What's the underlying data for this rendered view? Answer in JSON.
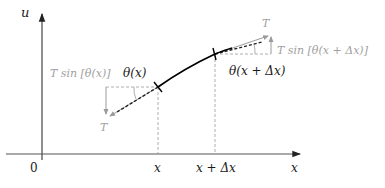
{
  "diagram": {
    "axes": {
      "y_label": "u",
      "x_label": "x",
      "origin_label": "0"
    },
    "ticks": {
      "x_left": "x",
      "x_right": "x + Δx"
    },
    "angles": {
      "left": "θ(x)",
      "right": "θ(x + Δx)"
    },
    "forces": {
      "left_tension": "T",
      "right_tension": "T",
      "left_vertical": "T sin [θ(x)]",
      "right_vertical": "T sin [θ(x + Δx)]"
    },
    "colors": {
      "curve": "#000000",
      "axis": "#333333",
      "force": "#9a9a9a",
      "guide": "#9a9a9a"
    }
  }
}
